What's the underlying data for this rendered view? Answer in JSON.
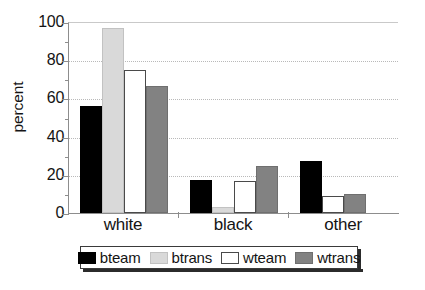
{
  "chart_data": {
    "type": "bar",
    "title": "",
    "xlabel": "",
    "ylabel": "percent",
    "ylim": [
      0,
      100
    ],
    "yticks": [
      0,
      20,
      40,
      60,
      80,
      100
    ],
    "yminorticks": [
      10,
      30,
      50,
      70,
      90
    ],
    "grid": "horizontal-dotted",
    "legend_position": "below-axis",
    "categories": [
      "white",
      "black",
      "other"
    ],
    "series": [
      {
        "name": "bteam",
        "color": "#000000",
        "values": [
          56,
          17.5,
          27
        ]
      },
      {
        "name": "btrans",
        "color": "#d9d9d9",
        "values": [
          97,
          3,
          0
        ]
      },
      {
        "name": "wteam",
        "color": "#ffffff",
        "values": [
          75,
          17,
          9
        ]
      },
      {
        "name": "wtrans",
        "color": "#828282",
        "values": [
          66.5,
          24.5,
          10
        ]
      }
    ]
  },
  "axes": {
    "y_title": "percent",
    "y_tick_labels": [
      "0",
      "20",
      "40",
      "60",
      "80",
      "100"
    ],
    "x_tick_labels": [
      "white",
      "black",
      "other"
    ]
  },
  "legend": {
    "items": [
      {
        "label": "bteam",
        "swatch": "black-swatch"
      },
      {
        "label": "btrans",
        "swatch": "light-gray-swatch"
      },
      {
        "label": "wteam",
        "swatch": "white-swatch"
      },
      {
        "label": "wtrans",
        "swatch": "medium-gray-swatch"
      }
    ]
  },
  "caption": {
    "text": ""
  }
}
